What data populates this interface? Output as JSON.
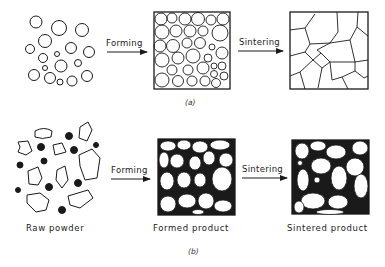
{
  "figure": {
    "panel_a": {
      "caption": "(a)",
      "arrow1_label": "Forming",
      "arrow2_label": "Sintering",
      "stages": [
        "loose spherical powder",
        "packed spheres",
        "polygonal grains"
      ]
    },
    "panel_b": {
      "caption": "(b)",
      "arrow1_label": "Forming",
      "arrow2_label": "Sintering",
      "stage_labels": [
        "Raw powder",
        "Formed product",
        "Sintered product"
      ]
    },
    "colors": {
      "ink": "#1a1a1a",
      "background": "#ffffff"
    }
  }
}
